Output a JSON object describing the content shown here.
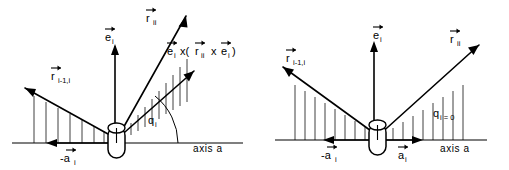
{
  "figure": {
    "panels": [
      {
        "id": "left",
        "name": "general-angle-configuration",
        "axis_label": "axis a",
        "angle_label": {
          "symbol": "q",
          "subscript": "i"
        },
        "vectors": [
          {
            "name": "r-ii-vector",
            "symbol": "r",
            "subscript": "ii",
            "overbar": true
          },
          {
            "name": "e-i-vector",
            "symbol": "e",
            "subscript": "i",
            "overbar": true
          },
          {
            "name": "r-i-minus-1-i-vector",
            "symbol": "r",
            "subscript": "i-1,i",
            "overbar": true
          },
          {
            "name": "minus-a-i-vector",
            "symbol": "-a",
            "subscript": "i",
            "overbar": true
          }
        ],
        "cross_product_label": {
          "name": "cross-product-label",
          "parts": [
            {
              "symbol": "e",
              "subscript": "i",
              "overbar": true
            },
            {
              "symbol": " x(",
              "subscript": "",
              "overbar": false
            },
            {
              "symbol": "r",
              "subscript": "ii",
              "overbar": true
            },
            {
              "symbol": " x ",
              "subscript": "",
              "overbar": false
            },
            {
              "symbol": "e",
              "subscript": "i",
              "overbar": true
            },
            {
              "symbol": ")",
              "subscript": "",
              "overbar": false
            }
          ]
        }
      },
      {
        "id": "right",
        "name": "zero-angle-configuration",
        "axis_label": "axis a",
        "angle_label": {
          "symbol": "q",
          "subscript": "i = 0"
        },
        "vectors": [
          {
            "name": "r-ii-vector",
            "symbol": "r",
            "subscript": "ii",
            "overbar": true
          },
          {
            "name": "e-i-vector",
            "symbol": "e",
            "subscript": "i",
            "overbar": true
          },
          {
            "name": "r-i-minus-1-i-vector",
            "symbol": "r",
            "subscript": "i-1,i",
            "overbar": true
          },
          {
            "name": "minus-a-i-vector",
            "symbol": "-a",
            "subscript": "i",
            "overbar": true
          },
          {
            "name": "plus-a-i-vector",
            "symbol": "a",
            "subscript": "i",
            "overbar": true
          }
        ]
      }
    ],
    "colors": {
      "ink": "#000000",
      "background": "#ffffff"
    }
  }
}
